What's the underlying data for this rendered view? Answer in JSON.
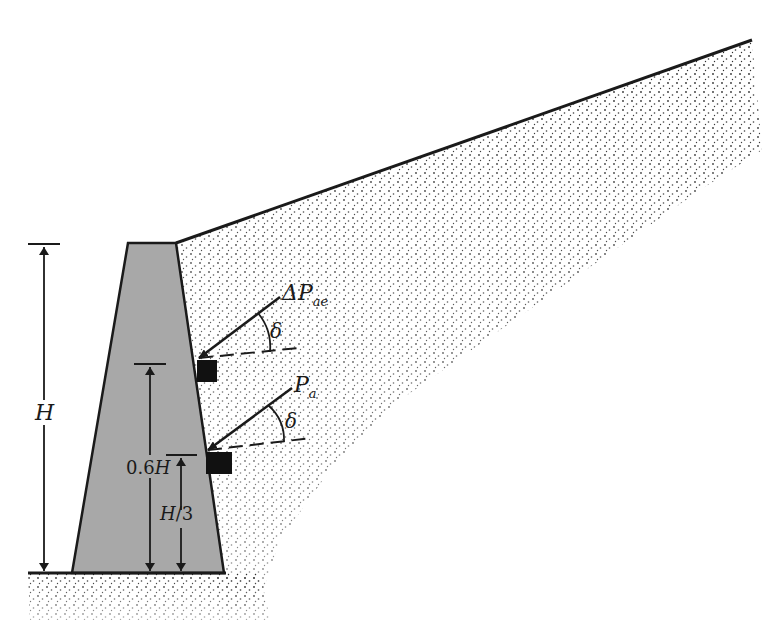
{
  "figure": {
    "type": "retaining-wall-seismic-earth-pressure",
    "colors": {
      "wall_fill": "#a8a8a8",
      "outline": "#1a1a1a",
      "soil_dots": "#2a2a2a",
      "block": "#111111",
      "background": "#ffffff"
    }
  },
  "labels": {
    "H": "H",
    "delta_pae_prefix": "ΔP",
    "delta_pae_sub": "ae",
    "pa_main": "P",
    "pa_sub": "a",
    "delta_angle_1": "δ",
    "delta_angle_2": "δ",
    "zero_six_h_num": "0.6",
    "zero_six_h_var": "H",
    "h_over_3_var": "H",
    "h_over_3_rest": "/3"
  }
}
